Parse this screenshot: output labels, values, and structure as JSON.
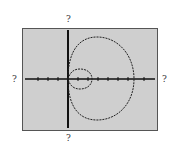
{
  "labels": {
    "top": "?",
    "bottom": "?",
    "left": "?",
    "right": "?"
  },
  "graph": {
    "type": "polar limaçon with inner loop",
    "background": "#cfcfcf",
    "curve_color": "#222222",
    "x_ticks": 10,
    "y_ticks": 0
  }
}
